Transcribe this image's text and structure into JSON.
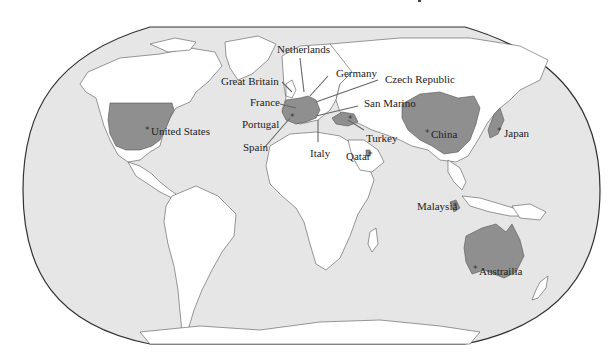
{
  "map": {
    "projection": "robinson-like world map",
    "colors": {
      "ocean": "#e6e6e6",
      "land": "#ffffff",
      "highlighted": "#8f8f8f",
      "outline": "#333333"
    },
    "labels": {
      "netherlands": "Netherlands",
      "great_britain": "Great Britain",
      "germany": "Germany",
      "czech_republic": "Czech Republic",
      "france": "France",
      "san_marino": "San Marino",
      "portugal": "Portugal",
      "spain": "Spain",
      "italy": "Italy",
      "turkey": "Turkey",
      "qatar": "Qatar",
      "united_states": "United States",
      "china": "China",
      "japan": "Japan",
      "malaysia": "Malaysia",
      "australia": "Austrailia"
    },
    "marker_icon": "star-icon",
    "marker_glyph": "*"
  }
}
